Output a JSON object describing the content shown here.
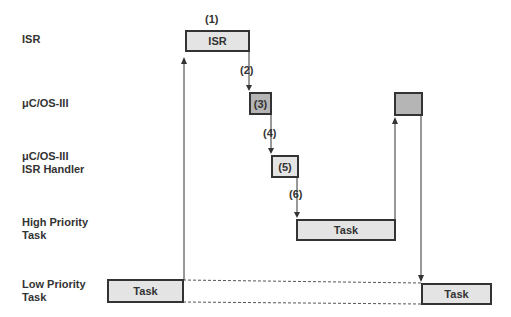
{
  "rows": {
    "isr": "ISR",
    "os": "μC/OS-III",
    "handler_line1": "μC/OS-III",
    "handler_line2": "ISR Handler",
    "high_line1": "High Priority",
    "high_line2": "Task",
    "low_line1": "Low Priority",
    "low_line2": "Task"
  },
  "boxes": {
    "isr": "ISR",
    "os_step": "(3)",
    "handler_step": "(5)",
    "high_task": "Task",
    "low_task_left": "Task",
    "low_task_right": "Task"
  },
  "steps": {
    "s1": "(1)",
    "s2": "(2)",
    "s4": "(4)",
    "s6": "(6)"
  }
}
